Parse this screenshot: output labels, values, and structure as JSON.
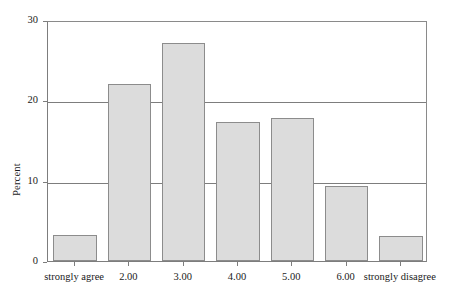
{
  "chart_data": {
    "type": "bar",
    "title": "",
    "subtitle": "",
    "xlabel": "",
    "ylabel": "Percent",
    "categories": [
      "strongly agree",
      "2.00",
      "3.00",
      "4.00",
      "5.00",
      "6.00",
      "strongly disagree"
    ],
    "values": [
      3.2,
      22.0,
      27.2,
      17.3,
      17.8,
      9.3,
      3.1
    ],
    "ylim": [
      0,
      30
    ],
    "yticks": [
      0,
      10,
      20,
      30
    ],
    "ytick_labels": [
      "0",
      "10",
      "20",
      "30"
    ],
    "grid": "horizontal",
    "legend": "none",
    "bar_fill_color": "#dcdcdc",
    "bar_border_color": "#8c8c8c",
    "axis_color": "#7d7d7d",
    "background_color": "#ffffff"
  }
}
